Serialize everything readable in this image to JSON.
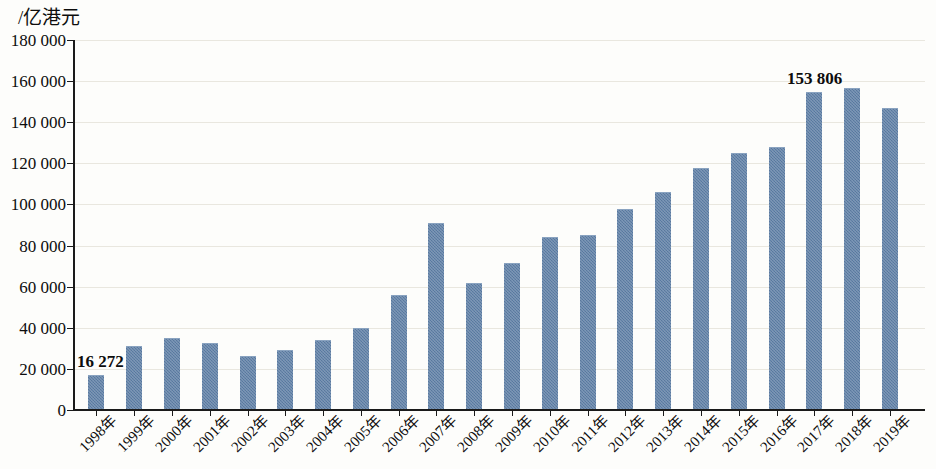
{
  "chart_data": {
    "type": "bar",
    "title": "",
    "subtitle": "",
    "xlabel": "",
    "ylabel": "/亿港元",
    "ylim": [
      0,
      180000
    ],
    "ytick_step": 20000,
    "ytick_labels": [
      "0",
      "20 000",
      "40 000",
      "60 000",
      "80 000",
      "100 000",
      "120 000",
      "140 000",
      "160 000",
      "180 000"
    ],
    "ytick_values": [
      0,
      20000,
      40000,
      60000,
      80000,
      100000,
      120000,
      140000,
      160000,
      180000
    ],
    "grid": true,
    "legend": "none",
    "bar_color": "#5e80a8",
    "categories": [
      "1998年",
      "1999年",
      "2000年",
      "2001年",
      "2002年",
      "2003年",
      "2004年",
      "2005年",
      "2006年",
      "2007年",
      "2008年",
      "2009年",
      "2010年",
      "2011年",
      "2012年",
      "2013年",
      "2014年",
      "2015年",
      "2016年",
      "2017年",
      "2018年",
      "2019年"
    ],
    "values": [
      16272,
      30100,
      34200,
      31400,
      25300,
      28400,
      33300,
      38800,
      55000,
      90000,
      61000,
      70400,
      83200,
      84000,
      97000,
      105000,
      117000,
      124000,
      126800,
      153806,
      155500,
      146000
    ],
    "annotations": [
      {
        "label": "16 272",
        "category": "1998年",
        "value": 16272
      },
      {
        "label": "153 806",
        "category": "2017年",
        "value": 153806
      }
    ]
  }
}
